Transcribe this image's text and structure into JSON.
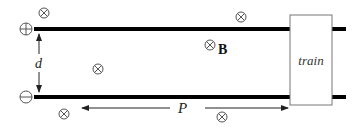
{
  "diagram": {
    "type": "railgun-train-schematic",
    "colors": {
      "rail": "#000000",
      "symbol": "#555555",
      "box_border": "#777777",
      "text": "#222222"
    },
    "terminals": {
      "positive": {
        "symbol": "⊕",
        "label": "positive-terminal"
      },
      "negative": {
        "symbol": "⊖",
        "label": "negative-terminal"
      }
    },
    "labels": {
      "separation": "d",
      "field": "B",
      "distance": "P",
      "train": "train"
    },
    "field_markers": [
      {
        "x": 44,
        "y": 13
      },
      {
        "x": 241,
        "y": 17
      },
      {
        "x": 210,
        "y": 45
      },
      {
        "x": 98,
        "y": 69
      },
      {
        "x": 64,
        "y": 114
      },
      {
        "x": 222,
        "y": 117
      }
    ]
  }
}
